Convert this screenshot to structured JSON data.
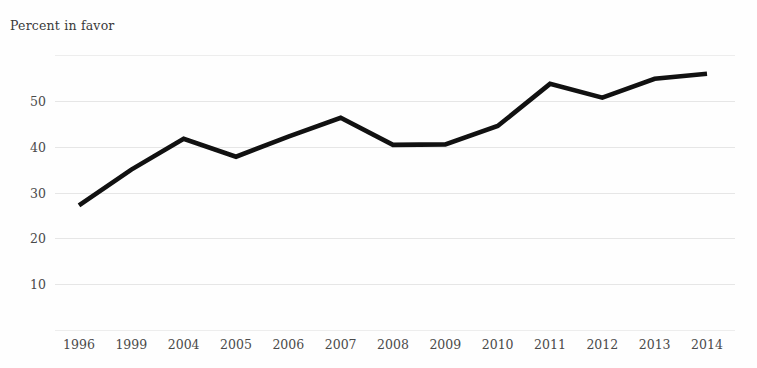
{
  "chart_data": {
    "type": "line",
    "title": "Percent in favor",
    "xlabel": "",
    "ylabel": "Percent in favor",
    "categories": [
      "1996",
      "1999",
      "2004",
      "2005",
      "2006",
      "2007",
      "2008",
      "2009",
      "2010",
      "2011",
      "2012",
      "2013",
      "2014"
    ],
    "values": [
      27.2,
      35.0,
      41.7,
      37.8,
      42.2,
      46.3,
      40.4,
      40.5,
      44.5,
      53.7,
      50.7,
      54.8,
      55.9
    ],
    "series": [
      {
        "name": "Percent in favor",
        "values": [
          27.2,
          35.0,
          41.7,
          37.8,
          42.2,
          46.3,
          40.4,
          40.5,
          44.5,
          53.7,
          50.7,
          54.8,
          55.9
        ]
      }
    ],
    "ylim": [
      0,
      60
    ],
    "yticks": [
      0,
      10,
      20,
      30,
      40,
      50,
      60
    ],
    "ytick_labels": [
      "",
      "10",
      "20",
      "30",
      "40",
      "50",
      ""
    ],
    "grid": true,
    "legend": "none",
    "line_color": "#111111",
    "grid_color": "#e6e6e6",
    "text_color": "#4a4a4a"
  },
  "yaxis": {
    "ticks": [
      {
        "value": 60,
        "label": ""
      },
      {
        "value": 50,
        "label": "50"
      },
      {
        "value": 40,
        "label": "40"
      },
      {
        "value": 30,
        "label": "30"
      },
      {
        "value": 20,
        "label": "20"
      },
      {
        "value": 10,
        "label": "10"
      },
      {
        "value": 0,
        "label": ""
      }
    ]
  },
  "xaxis": {
    "labels": [
      "1996",
      "1999",
      "2004",
      "2005",
      "2006",
      "2007",
      "2008",
      "2009",
      "2010",
      "2011",
      "2012",
      "2013",
      "2014"
    ]
  }
}
